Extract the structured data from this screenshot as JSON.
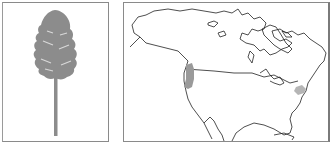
{
  "figure": {
    "panels": [
      {
        "id": "tree",
        "label": "tree silhouette",
        "description": "Tall conifer with narrow conical crown and long bare trunk"
      },
      {
        "id": "map",
        "label": "North America range map",
        "description": "Outline map of North America with shaded range areas"
      }
    ],
    "colors": {
      "tree_fill": "#8c8c8c",
      "range_west": "#9a9a9a",
      "range_east": "#b5b5b5",
      "outline": "#222222",
      "border": "#8a8a8a"
    },
    "range_regions": [
      "Pacific Northwest (Oregon/California)",
      "Eastern United States (Mid-Atlantic)"
    ]
  }
}
